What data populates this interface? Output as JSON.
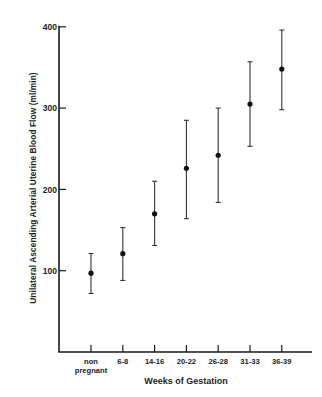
{
  "chart_data": {
    "type": "scatter",
    "subtype": "point_with_error_bars",
    "title": "",
    "xlabel": "Weeks of Gestation",
    "ylabel": "Unilateral Ascending Arterial Uterine Blood Flow (ml/min)",
    "categories": [
      "non pregnant",
      "6-8",
      "14-16",
      "20-22",
      "26-28",
      "31-33",
      "36-39"
    ],
    "category_lines": [
      [
        "non",
        "pregnant"
      ],
      [
        "6-8"
      ],
      [
        "14-16"
      ],
      [
        "20-22"
      ],
      [
        "26-28"
      ],
      [
        "31-33"
      ],
      [
        "36-39"
      ]
    ],
    "series": [
      {
        "name": "Mean blood flow",
        "values": [
          97,
          121,
          170,
          226,
          242,
          305,
          348
        ],
        "error_upper": [
          121,
          153,
          210,
          285,
          300,
          357,
          396
        ],
        "error_lower": [
          72,
          88,
          131,
          164,
          184,
          253,
          298
        ]
      }
    ],
    "ylim": [
      0,
      400
    ],
    "yticks": [
      100,
      200,
      300,
      400
    ],
    "grid": false,
    "legend": "none"
  }
}
